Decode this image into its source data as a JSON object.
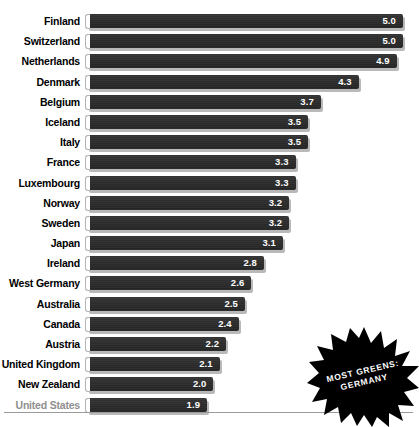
{
  "chart_data": {
    "type": "bar",
    "orientation": "horizontal",
    "title": "",
    "subtitle": "",
    "xlabel": "",
    "ylabel": "",
    "grid": false,
    "legend": null,
    "xlim": [
      0,
      5.0
    ],
    "value_precision": 1,
    "categories": [
      "Finland",
      "Switzerland",
      "Netherlands",
      "Denmark",
      "Belgium",
      "Iceland",
      "Italy",
      "France",
      "Luxembourg",
      "Norway",
      "Sweden",
      "Japan",
      "Ireland",
      "West Germany",
      "Australia",
      "Canada",
      "Austria",
      "United Kingdom",
      "New Zealand",
      "United States"
    ],
    "values": [
      5.0,
      5.0,
      4.9,
      4.3,
      3.7,
      3.5,
      3.5,
      3.3,
      3.3,
      3.2,
      3.2,
      3.1,
      2.8,
      2.6,
      2.5,
      2.4,
      2.2,
      2.1,
      2.0,
      1.9
    ],
    "value_labels": [
      "5.0",
      "5.0",
      "4.9",
      "4.3",
      "3.7",
      "3.5",
      "3.5",
      "3.3",
      "3.3",
      "3.2",
      "3.2",
      "3.1",
      "2.8",
      "2.6",
      "2.5",
      "2.4",
      "2.2",
      "2.1",
      "2.0",
      "1.9"
    ],
    "highlighted_category": "United States",
    "annotations": [
      {
        "name": "most-greens-badge",
        "shape": "starburst",
        "lines": [
          "MOST GREENS:",
          "GERMANY"
        ]
      }
    ]
  },
  "colors": {
    "bar_fill": "#2b2b2b",
    "bar_shadow": "#b9b9b9",
    "bar_cap_outline": "#b4b4b4",
    "value_text": "#ffffff",
    "label_text": "#000000",
    "label_text_muted": "#8f8f8f",
    "baseline_rule": "#9a9a9a",
    "badge_fill": "#000000",
    "badge_text": "#ffffff",
    "background": "#ffffff"
  },
  "badge": {
    "line1": "MOST GREENS:",
    "line2": "GERMANY"
  }
}
